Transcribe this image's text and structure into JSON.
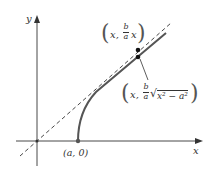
{
  "diagram": {
    "axes": {
      "x_label": "x",
      "y_label": "y"
    },
    "vertex_label": "(a, 0)",
    "asymptote_point": {
      "prefix": "x,",
      "num": "b",
      "den": "a",
      "suffix": "x"
    },
    "curve_point": {
      "prefix": "x,",
      "num": "b",
      "den": "a",
      "radical": "x² − a²"
    },
    "colors": {
      "curve": "#555555",
      "axis": "#333333",
      "point": "#111111"
    }
  }
}
